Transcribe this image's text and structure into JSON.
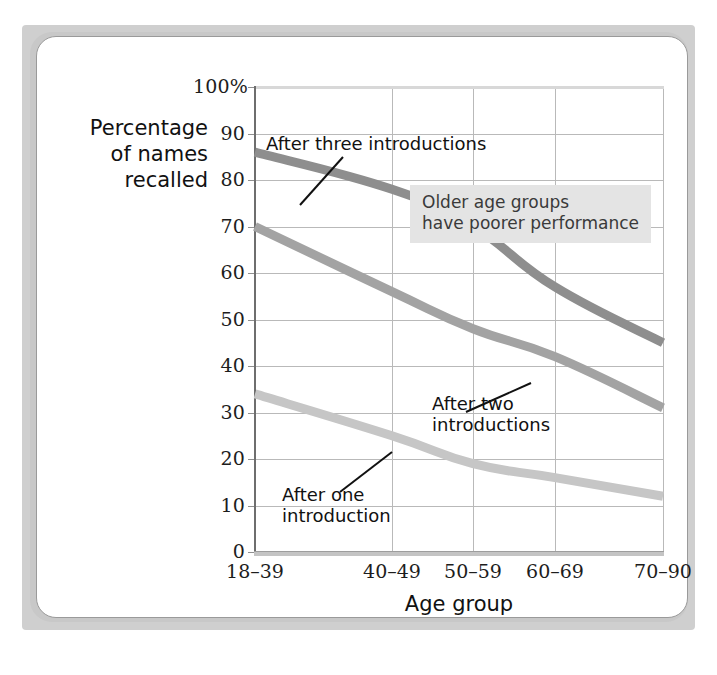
{
  "figure": {
    "kind": "line-chart-figure"
  },
  "chart_data": {
    "type": "line",
    "title": "",
    "xlabel": "Age group",
    "ylabel": "Percentage of names recalled",
    "ylabel_lines": [
      "Percentage",
      "of names",
      "recalled"
    ],
    "categories": [
      "18–39",
      "40–49",
      "50–59",
      "60–69",
      "70–90"
    ],
    "ylim": [
      0,
      100
    ],
    "ytick_labels": [
      "0",
      "10",
      "20",
      "30",
      "40",
      "50",
      "60",
      "70",
      "80",
      "90",
      "100%"
    ],
    "ytick_values": [
      0,
      10,
      20,
      30,
      40,
      50,
      60,
      70,
      80,
      90,
      100
    ],
    "grid": "both",
    "legend": "inline-annotations",
    "series": [
      {
        "name": "After three introductions",
        "values": [
          86,
          78,
          70,
          57,
          45
        ],
        "color": "#8e8e8e"
      },
      {
        "name": "After two introductions",
        "values": [
          70,
          56,
          48,
          42,
          31
        ],
        "color": "#a3a3a3"
      },
      {
        "name": "After one introduction",
        "values": [
          34,
          25,
          19,
          16,
          12
        ],
        "color": "#c6c6c6"
      }
    ],
    "annotations": [
      {
        "id": "annot-three",
        "text": "After three introductions",
        "target_series": "After three introductions"
      },
      {
        "id": "annot-two",
        "text_lines": [
          "After two",
          "introductions"
        ],
        "target_series": "After two introductions"
      },
      {
        "id": "annot-one",
        "text_lines": [
          "After one",
          "introduction"
        ],
        "target_series": "After one introduction"
      },
      {
        "id": "callout",
        "text_lines": [
          "Older age groups",
          "have poorer performance"
        ],
        "style": "shaded-box",
        "background": "#e4e4e4"
      }
    ]
  },
  "colors": {
    "mat": "#cfcfcf",
    "card_border": "#9a9a9a",
    "gridline": "#b9b9b9",
    "axis": "#6e6e6e",
    "text": "#111111",
    "callout_bg": "#e4e4e4",
    "callout_text": "#3a3a3a"
  }
}
